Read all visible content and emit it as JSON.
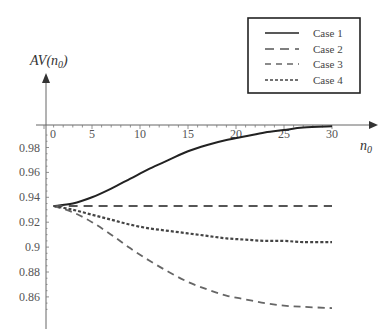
{
  "chart_data": {
    "type": "line",
    "title": "",
    "xlabel": "n0",
    "ylabel": "AV(n0)",
    "xlim": [
      0,
      30
    ],
    "ylim": [
      0.85,
      1.0
    ],
    "x_ticks": [
      0,
      5,
      10,
      15,
      20,
      25,
      30
    ],
    "x_tick_labels": [
      "0",
      "5",
      "10",
      "15",
      "20",
      "25",
      "30"
    ],
    "y_ticks": [
      0.98,
      0.96,
      0.94,
      0.92,
      0.9,
      0.88,
      0.86
    ],
    "y_tick_labels": [
      "0.98",
      "0.96",
      "0.94",
      "0.92",
      "0.9",
      "0.88",
      "0.86"
    ],
    "grid": false,
    "legend_position": "upper right",
    "x": [
      1,
      3,
      5,
      7,
      9,
      11,
      13,
      15,
      17,
      19,
      21,
      23,
      25,
      27,
      30
    ],
    "series": [
      {
        "name": "Case 1",
        "style": "solid",
        "color": "#222222",
        "values": [
          0.933,
          0.935,
          0.94,
          0.947,
          0.955,
          0.963,
          0.97,
          0.977,
          0.982,
          0.986,
          0.989,
          0.992,
          0.994,
          0.996,
          0.997
        ]
      },
      {
        "name": "Case 2",
        "style": "long-dash",
        "color": "#555555",
        "values": [
          0.933,
          0.933,
          0.933,
          0.933,
          0.933,
          0.933,
          0.933,
          0.933,
          0.933,
          0.933,
          0.933,
          0.933,
          0.933,
          0.933,
          0.933
        ]
      },
      {
        "name": "Case 3",
        "style": "dash",
        "color": "#666666",
        "values": [
          0.933,
          0.928,
          0.92,
          0.91,
          0.899,
          0.889,
          0.88,
          0.872,
          0.866,
          0.861,
          0.858,
          0.855,
          0.853,
          0.852,
          0.851
        ]
      },
      {
        "name": "Case 4",
        "style": "dotted-dash",
        "color": "#444444",
        "values": [
          0.933,
          0.93,
          0.926,
          0.922,
          0.918,
          0.915,
          0.913,
          0.911,
          0.909,
          0.907,
          0.906,
          0.905,
          0.905,
          0.904,
          0.904
        ]
      }
    ]
  },
  "axes": {
    "y_title_main": "AV(n",
    "y_title_sub": "0",
    "y_title_close": ")",
    "x_title_main": "n",
    "x_title_sub": "0"
  },
  "legend": {
    "items": [
      {
        "label": "Case 1"
      },
      {
        "label": "Case 2"
      },
      {
        "label": "Case 3"
      },
      {
        "label": "Case 4"
      }
    ]
  }
}
